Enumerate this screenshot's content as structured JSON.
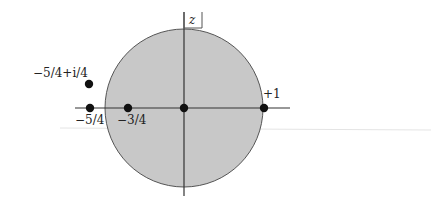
{
  "title_label": "z",
  "region": {
    "description": "closed unit disk |z| <= 1",
    "fill": "#c8c8c8",
    "stroke": "#555555"
  },
  "points": [
    {
      "id": "p-minus-5-4-plus-i-4",
      "label": "−5/4+i/4",
      "re": -1.25,
      "im": 0.25
    },
    {
      "id": "p-minus-5-4",
      "label": "−5/4",
      "re": -1.25,
      "im": 0
    },
    {
      "id": "p-minus-3-4",
      "label": "−3/4",
      "re": -0.75,
      "im": 0
    },
    {
      "id": "p-origin",
      "label": "",
      "re": 0,
      "im": 0
    },
    {
      "id": "p-plus-1",
      "label": "+1",
      "re": 1,
      "im": 0
    }
  ],
  "colors": {
    "axis": "#333333",
    "point": "#111111"
  }
}
